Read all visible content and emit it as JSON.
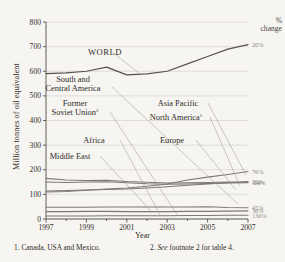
{
  "axes": {
    "ylabel": "Million tonnes of oil equivalent",
    "xlabel": "Year",
    "yticks": [
      "0",
      "100",
      "200",
      "300",
      "400",
      "500",
      "600",
      "700",
      "800"
    ],
    "xticks": [
      "1997",
      "1999",
      "2001",
      "2003",
      "2005",
      "2007"
    ]
  },
  "pct_header": {
    "line1": "%",
    "line2": "change"
  },
  "footnotes": {
    "one": "1. Canada, USA and Mexico.",
    "two_num": "2. ",
    "two_em": "See",
    "two_rest": " footnote 2 for table 4."
  },
  "labels": {
    "world": "WORLD",
    "south_central_1": "South and",
    "south_central_2": "Central America",
    "fsu_1": "Former",
    "fsu_2": "Soviet Union",
    "fsu_sup": "2",
    "asia_pacific": "Asia Pacific",
    "north_america": "North America",
    "na_sup": "1",
    "africa": "Africa",
    "europe": "Europe",
    "middle_east": "Middle East"
  },
  "chart_data": {
    "type": "line",
    "title": "",
    "xlabel": "Year",
    "ylabel": "Million tonnes of oil equivalent",
    "xlim": [
      1997,
      2007
    ],
    "ylim": [
      0,
      800
    ],
    "grid": true,
    "legend": "inline-labels-with-leader-lines",
    "x": [
      1997,
      1998,
      1999,
      2000,
      2001,
      2002,
      2003,
      2004,
      2005,
      2006,
      2007
    ],
    "series": [
      {
        "name": "WORLD",
        "pct_change": "20%",
        "values": [
          590,
          593,
          600,
          617,
          585,
          589,
          600,
          630,
          660,
          690,
          708
        ]
      },
      {
        "name": "Asia Pacific",
        "pct_change": "76%",
        "values": [
          110,
          112,
          117,
          122,
          126,
          133,
          142,
          158,
          170,
          181,
          193
        ]
      },
      {
        "name": "Europe",
        "pct_change": "32%",
        "values": [
          114,
          116,
          118,
          120,
          122,
          126,
          131,
          137,
          142,
          147,
          152
        ]
      },
      {
        "name": "North America",
        "pct_change": "-14%",
        "values": [
          165,
          158,
          156,
          157,
          152,
          149,
          146,
          147,
          148,
          150,
          149
        ]
      },
      {
        "name": "Former Soviet Union",
        "pct_change": "1%",
        "values": [
          150,
          148,
          150,
          151,
          147,
          143,
          141,
          142,
          144,
          146,
          147
        ]
      },
      {
        "name": "Middle East",
        "pct_change": "45%",
        "values": [
          48,
          48,
          48,
          49,
          49,
          49,
          49,
          49,
          50,
          47,
          46
        ]
      },
      {
        "name": "South and Central America",
        "pct_change": "36%",
        "values": [
          30,
          30,
          31,
          31,
          30,
          30,
          30,
          31,
          31,
          32,
          33
        ]
      },
      {
        "name": "Africa",
        "pct_change": "130%",
        "values": [
          12,
          12,
          12,
          13,
          13,
          13,
          13,
          14,
          14,
          15,
          15
        ]
      }
    ],
    "pct_labels": [
      "20%",
      "76%",
      "32%",
      "-14%",
      "1%",
      "45%",
      "36%",
      "130%"
    ]
  }
}
